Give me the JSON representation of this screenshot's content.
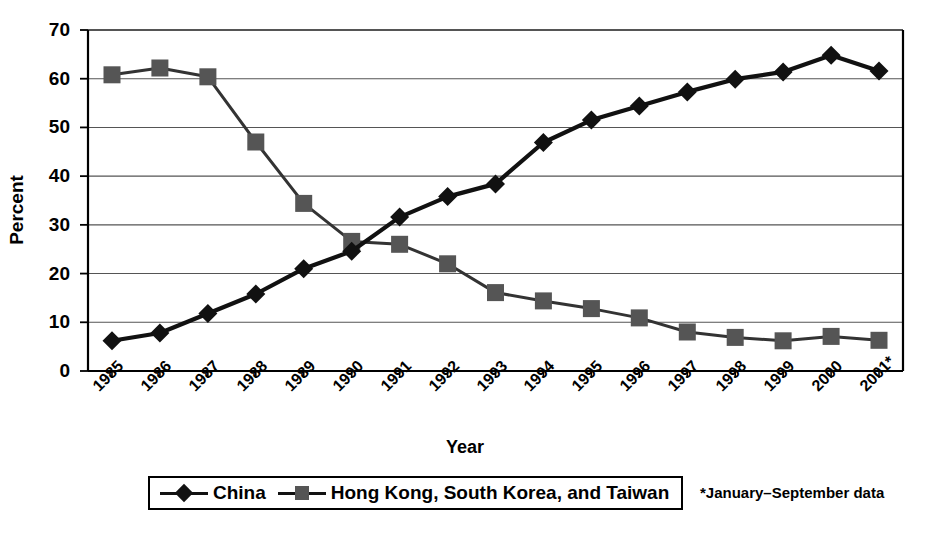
{
  "chart_data": {
    "type": "line",
    "title": "",
    "xlabel": "Year",
    "ylabel": "Percent",
    "ylim": [
      0,
      70
    ],
    "ytick_step": 10,
    "yticks": [
      "0",
      "10",
      "20",
      "30",
      "40",
      "50",
      "60",
      "70"
    ],
    "grid": true,
    "legend_position": "bottom",
    "categories": [
      "1985",
      "1986",
      "1987",
      "1988",
      "1989",
      "1990",
      "1991",
      "1992",
      "1993",
      "1994",
      "1995",
      "1996",
      "1997",
      "1998",
      "1999",
      "2000",
      "2001*"
    ],
    "series": [
      {
        "name": "China",
        "marker": "diamond",
        "color": "#111111",
        "values": [
          6.2,
          7.8,
          11.8,
          15.8,
          21.0,
          24.6,
          31.6,
          35.8,
          38.4,
          46.9,
          51.5,
          54.4,
          57.3,
          59.9,
          61.4,
          64.8,
          61.6
        ]
      },
      {
        "name": "Hong Kong, South Korea, and Taiwan",
        "marker": "square",
        "color": "#555555",
        "values": [
          60.8,
          62.2,
          60.4,
          47.0,
          34.4,
          26.6,
          26.0,
          22.0,
          16.1,
          14.4,
          12.8,
          10.9,
          8.0,
          6.9,
          6.2,
          7.1,
          6.3
        ]
      }
    ],
    "footnote": "*January–September data"
  },
  "legend": {
    "entries": [
      {
        "label": "China",
        "marker": "diamond"
      },
      {
        "label": "Hong Kong, South Korea, and Taiwan",
        "marker": "square"
      }
    ]
  },
  "colors": {
    "china_line": "#111111",
    "hkskt_line": "#333333",
    "hkskt_marker": "#555555",
    "axis": "#000000",
    "grid": "#555555",
    "background": "#ffffff"
  }
}
